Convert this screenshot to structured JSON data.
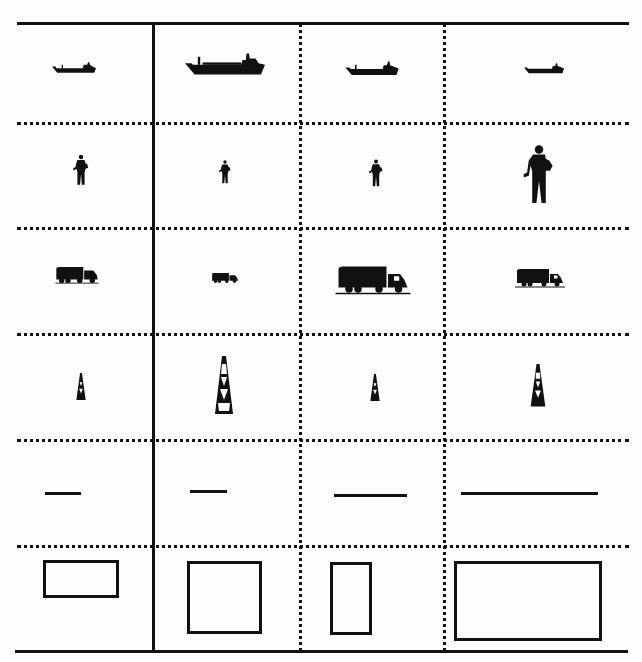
{
  "diagram": {
    "layout": {
      "columns": 4,
      "rows": 6
    },
    "colors": {
      "ink": "#111111",
      "background": "#fdfdfd"
    },
    "rows": [
      {
        "name": "ships",
        "icon": "ship-icon",
        "relative_sizes": [
          0.45,
          1.0,
          0.65,
          0.5
        ]
      },
      {
        "name": "workers",
        "icon": "worker-icon",
        "relative_sizes": [
          0.55,
          0.45,
          0.55,
          1.0
        ]
      },
      {
        "name": "tank-trucks",
        "icon": "tanker-truck-icon",
        "relative_sizes": [
          0.5,
          0.35,
          1.0,
          0.7
        ]
      },
      {
        "name": "oil-derricks",
        "icon": "oil-derrick-icon",
        "relative_sizes": [
          0.35,
          1.0,
          0.35,
          0.6
        ]
      },
      {
        "name": "lines",
        "icon": "line-segment",
        "relative_lengths": [
          0.27,
          0.27,
          0.54,
          1.0
        ]
      },
      {
        "name": "rectangles",
        "icon": "rectangle-outline",
        "sizes_px": [
          [
            75,
            38
          ],
          [
            74,
            72
          ],
          [
            40,
            72
          ],
          [
            146,
            78
          ]
        ]
      }
    ]
  }
}
